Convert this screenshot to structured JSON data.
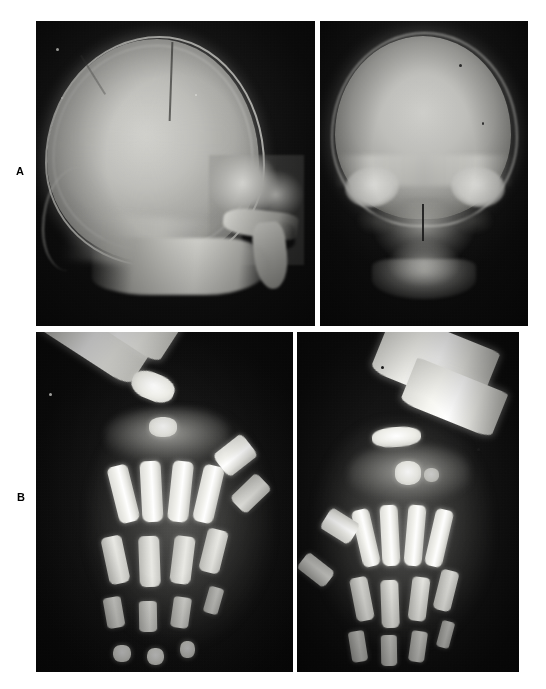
{
  "figure": {
    "background_color": "#ffffff",
    "panels": [
      {
        "id": "panel-a",
        "label": "A",
        "images": [
          {
            "id": "xr-skull-lateral",
            "modality": "radiograph",
            "view": "lateral",
            "region": "skull",
            "film_color": "#101010",
            "bone_color": "#e8e8e3"
          },
          {
            "id": "xr-skull-ap",
            "modality": "radiograph",
            "view": "anteroposterior",
            "region": "skull",
            "film_color": "#101010",
            "bone_color": "#e8e8e3"
          }
        ]
      },
      {
        "id": "panel-b",
        "label": "B",
        "images": [
          {
            "id": "xr-hand-left",
            "modality": "radiograph",
            "view": "posteroanterior",
            "region": "left hand and wrist",
            "film_color": "#0e0e0e",
            "bone_color": "#ffffff"
          },
          {
            "id": "xr-hand-right",
            "modality": "radiograph",
            "view": "posteroanterior",
            "region": "right hand and wrist",
            "film_color": "#0e0e0e",
            "bone_color": "#ffffff"
          }
        ]
      }
    ]
  }
}
